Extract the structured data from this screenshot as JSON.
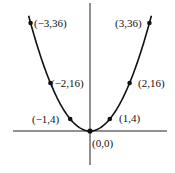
{
  "chart_data": {
    "type": "line",
    "title": "",
    "xlabel": "",
    "ylabel": "",
    "function": "y = 4x^2",
    "grid": false,
    "legend": null,
    "xlim": [
      -3.5,
      3.5
    ],
    "ylim": [
      -8,
      50
    ],
    "points": [
      {
        "x": -3,
        "y": 36,
        "label": "(−3,36)"
      },
      {
        "x": -2,
        "y": 16,
        "label": "(−2,16)"
      },
      {
        "x": -1,
        "y": 4,
        "label": "(−1,4)"
      },
      {
        "x": 0,
        "y": 0,
        "label": "(0,0)"
      },
      {
        "x": 1,
        "y": 4,
        "label": "(1,4)"
      },
      {
        "x": 2,
        "y": 16,
        "label": "(2,16)"
      },
      {
        "x": 3,
        "y": 36,
        "label": "(3,36)"
      }
    ],
    "colors": {
      "curve": "#111111",
      "axes": "#222222",
      "points": "#111111"
    }
  }
}
